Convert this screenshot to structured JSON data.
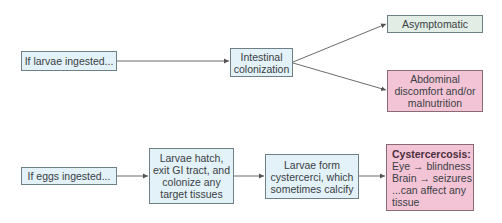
{
  "diagram": {
    "row1": {
      "start": {
        "label": "If larvae ingested..."
      },
      "middle": {
        "lines": [
          "Intestinal",
          "colonization"
        ]
      },
      "outcome_a": {
        "label": "Asymptomatic"
      },
      "outcome_b": {
        "lines": [
          "Abdominal",
          "discomfort and/or",
          "malnutrition"
        ]
      }
    },
    "row2": {
      "start": {
        "label": "If eggs ingested..."
      },
      "step1": {
        "lines": [
          "Larvae hatch,",
          "exit GI tract, and",
          "colonize any",
          "target tissues"
        ]
      },
      "step2": {
        "lines": [
          "Larvae form",
          "cystercerci, which",
          "sometimes calcify"
        ]
      },
      "outcome": {
        "title": "Cystercercosis:",
        "lines": [
          "Eye → blindness",
          "Brain → seizures",
          "...can affect any",
          "tissue"
        ]
      }
    },
    "colors": {
      "blue_box": "#e3f1f8",
      "green_box": "#e2ede5",
      "pink_box": "#f3c4d6",
      "border": "#6f7f86",
      "arrow": "#6b6b6b"
    }
  }
}
